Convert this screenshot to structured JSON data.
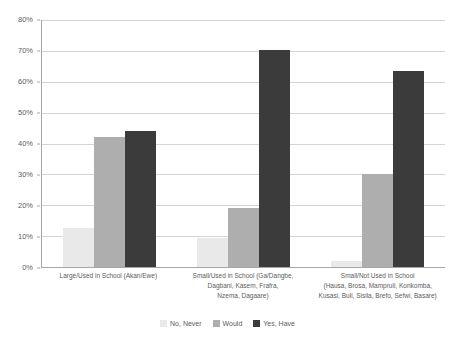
{
  "chart_data": {
    "type": "bar",
    "title": "",
    "subtitle": "",
    "xlabel": "",
    "ylabel": "",
    "ylim": [
      0,
      80
    ],
    "y_tick_labels": [
      "0%",
      "10%",
      "20%",
      "30%",
      "40%",
      "50%",
      "60%",
      "70%",
      "80%"
    ],
    "y_tick_values": [
      0,
      10,
      20,
      30,
      40,
      50,
      60,
      70,
      80
    ],
    "grid": true,
    "legend_position": "bottom",
    "categories": [
      "Large/Used in School (Akan/Ewe)",
      "Small/Used in School (Ga/Dangbe, Dagbani, Kasem, Frafra, Nzema, Dagaare)",
      "Small/Not Used in School (Hausa, Brosa, Mampruli, Konkomba, Kusasi, Buli, Sisila, Brefo, Sefwi, Basare)"
    ],
    "category_lines": [
      [
        "Large/Used in School (Akan/Ewe)"
      ],
      [
        "Small/Used in School (Ga/Dangbe,",
        "Dagbani, Kasem, Frafra,",
        "Nzema, Dagaare)"
      ],
      [
        "Small/Not Used in School",
        "(Hausa, Brosa, Mampruli, Konkomba,",
        "Kusasi, Buli, Sisila, Brefo, Sefwi, Basare)"
      ]
    ],
    "series": [
      {
        "name": "No, Never",
        "color": "#e9e9e9",
        "values": [
          12.5,
          9.3,
          2.0
        ]
      },
      {
        "name": "Would",
        "color": "#aeaeae",
        "values": [
          42.0,
          19.0,
          30.0
        ]
      },
      {
        "name": "Yes, Have",
        "color": "#3b3b3b",
        "values": [
          44.0,
          70.2,
          63.5
        ]
      }
    ]
  },
  "legend": {
    "items": [
      {
        "label": "No, Never"
      },
      {
        "label": "Would"
      },
      {
        "label": "Yes, Have"
      }
    ]
  },
  "colors": {
    "series_no_never": "#e9e9e9",
    "series_would": "#aeaeae",
    "series_yes_have": "#3b3b3b",
    "gridline": "#d4d4d4",
    "axis": "#a6a6a6",
    "text": "#5c5c5c",
    "background": "#ffffff"
  }
}
